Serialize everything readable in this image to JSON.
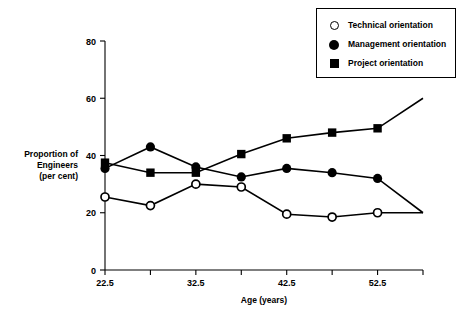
{
  "chart_data": {
    "type": "line",
    "title": "",
    "xlabel": "Age (years)",
    "ylabel": "Proportion of Engineers (per cent)",
    "ylabel_lines": [
      "Proportion of",
      "Engineers",
      "(per cent)"
    ],
    "x": [
      22.5,
      27.5,
      32.5,
      37.5,
      42.5,
      47.5,
      52.5,
      57.5
    ],
    "xtick_values": [
      22.5,
      27.5,
      32.5,
      37.5,
      42.5,
      47.5,
      52.5,
      57.5
    ],
    "xtick_labels": [
      "22.5",
      "",
      "32.5",
      "",
      "42.5",
      "",
      "52.5",
      ""
    ],
    "xlim": [
      22.5,
      57.5
    ],
    "ytick_values": [
      0,
      20,
      40,
      60,
      80
    ],
    "ytick_labels": [
      "0",
      "20",
      "40",
      "60",
      "80"
    ],
    "ylim": [
      0,
      80
    ],
    "grid": false,
    "legend_position": "top-right",
    "series": [
      {
        "name": "Technical orientation",
        "marker": "open-circle",
        "values": [
          25.5,
          22.5,
          30,
          29,
          19.5,
          18.5,
          20,
          20
        ]
      },
      {
        "name": "Management orientation",
        "marker": "filled-circle",
        "values": [
          35.5,
          43,
          36,
          32.5,
          35.5,
          34,
          32,
          20
        ]
      },
      {
        "name": "Project orientation",
        "marker": "filled-square",
        "values": [
          37.5,
          34,
          34,
          40.5,
          46,
          48,
          49.5,
          60
        ]
      }
    ]
  },
  "legend": {
    "items": [
      {
        "label": "Technical orientation",
        "marker": "open-circle-icon"
      },
      {
        "label": "Management orientation",
        "marker": "filled-circle-icon"
      },
      {
        "label": "Project orientation",
        "marker": "filled-square-icon"
      }
    ]
  },
  "colors": {
    "ink": "#000000",
    "background": "#ffffff"
  }
}
